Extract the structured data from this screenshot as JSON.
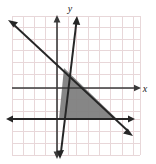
{
  "figure": {
    "kind": "coordinate-plane-graph",
    "width": 156,
    "height": 164,
    "background_color": "#ffffff",
    "axis_color": "#3a3a3a",
    "grid_color": "#e8d7d9",
    "shade_color": "#807f80",
    "line_color": "#262626",
    "x_axis_label": "x",
    "y_axis_label": "y"
  },
  "chart_data": {
    "type": "line",
    "title": "",
    "subtitle": "",
    "xlabel": "x",
    "ylabel": "y",
    "grid": true,
    "legend": "none",
    "xlim": [
      -4,
      7
    ],
    "ylim": [
      -6,
      6
    ],
    "x_tick_labels": [],
    "y_tick_labels": [],
    "pixel_geometry": {
      "grid_left": 12,
      "grid_top": 16,
      "grid_right": 140,
      "grid_bottom": 155,
      "cell_size": 11.6,
      "origin_x": 57,
      "origin_y": 88,
      "x_axis_arrow_tip": [
        140,
        88
      ],
      "x_label_pos": [
        145,
        91
      ],
      "y_label_pos": [
        70,
        11
      ]
    },
    "series": [
      {
        "name": "steep-increasing-line",
        "type": "line",
        "style": "solid",
        "arrows": "both",
        "pixel_points": [
          [
            59.5,
            158
          ],
          [
            77,
            16
          ]
        ]
      },
      {
        "name": "descending-line",
        "type": "line",
        "style": "solid",
        "arrows": "both",
        "pixel_points": [
          [
            9,
            21
          ],
          [
            132,
            135
          ]
        ]
      },
      {
        "name": "horizontal-boundary-line",
        "type": "line",
        "style": "solid",
        "arrows": "both",
        "pixel_points": [
          [
            7,
            119
          ],
          [
            134,
            119
          ]
        ]
      },
      {
        "name": "x-axis",
        "type": "axis",
        "arrows": "right",
        "pixel_points": [
          [
            12,
            88
          ],
          [
            141,
            88
          ]
        ]
      },
      {
        "name": "y-axis",
        "type": "axis",
        "arrows": "both",
        "pixel_points": [
          [
            57,
            16
          ],
          [
            57,
            158
          ]
        ]
      }
    ],
    "shaded_regions": [
      {
        "name": "solution-region",
        "shape": "triangle",
        "fill": "#807f80",
        "pixel_vertices": [
          [
            64,
            68
          ],
          [
            59,
            119
          ],
          [
            117,
            119
          ]
        ]
      }
    ],
    "annotations": []
  }
}
